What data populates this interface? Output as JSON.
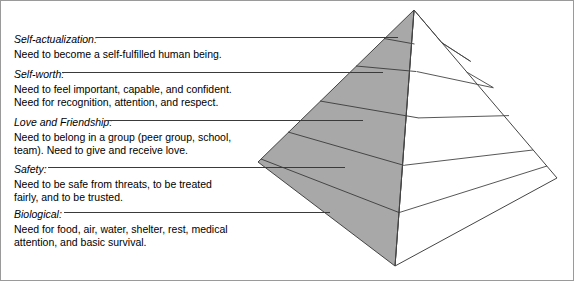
{
  "figure": {
    "background_color": "#ffffff",
    "border_color": "#9a9a9a"
  },
  "pyramid": {
    "shaded_face_color": "#a8a8a8",
    "unshaded_face_color": "#ffffff",
    "outline_color": "#444444",
    "tier_count": 5,
    "apex": {
      "x": 414,
      "y": 10
    },
    "left_corner": {
      "x": 258,
      "y": 162
    },
    "front_corner": {
      "x": 395,
      "y": 266
    },
    "right_corner": {
      "x": 557,
      "y": 178
    },
    "tiers_bottom_to_top": [
      "Biological",
      "Safety",
      "Love and Friendship",
      "Self-worth",
      "Self-actualization"
    ]
  },
  "needs": [
    {
      "id": "self-actualization",
      "title": "Self-actualization:",
      "description": "Need to become a self-fulfilled human being.",
      "leader_line": {
        "y": 37,
        "x_start": 96,
        "x_end": 398
      }
    },
    {
      "id": "self-worth",
      "title": "Self-worth:",
      "description": "Need to feel important, capable, and confident.\nNeed for recognition, attention, and respect.",
      "leader_line": {
        "y": 72,
        "x_start": 62,
        "x_end": 383
      }
    },
    {
      "id": "love-and-friendship",
      "title": "Love and Friendship:",
      "description": "Need to belong in a group (peer group, school,\nteam). Need to give and receive love.",
      "leader_line": {
        "y": 120,
        "x_start": 106,
        "x_end": 363
      }
    },
    {
      "id": "safety",
      "title": "Safety:",
      "description": "Need to be safe from threats, to be treated\nfairly, and to be trusted.",
      "leader_line": {
        "y": 167,
        "x_start": 48,
        "x_end": 345
      }
    },
    {
      "id": "biological",
      "title": "Biological:",
      "description": "Need for food, air, water, shelter, rest, medical\nattention, and basic survival.",
      "leader_line": {
        "y": 212,
        "x_start": 64,
        "x_end": 330
      }
    }
  ]
}
